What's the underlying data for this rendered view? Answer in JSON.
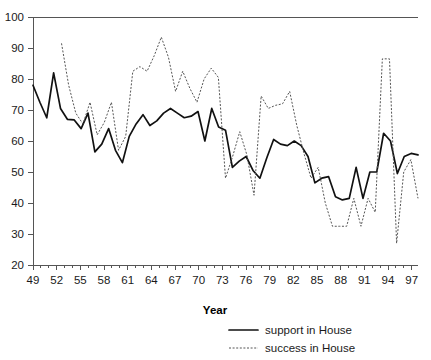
{
  "chart_data": {
    "type": "line",
    "title": "",
    "xlabel": "Year",
    "ylabel": "",
    "xlim": [
      49,
      97.8
    ],
    "ylim": [
      20,
      100
    ],
    "grid": false,
    "legend_position": "bottom-right",
    "x_tick_labels": [
      "49",
      "52",
      "55",
      "58",
      "61",
      "64",
      "67",
      "70",
      "73",
      "76",
      "79",
      "82",
      "85",
      "88",
      "91",
      "94",
      "97"
    ],
    "x_tick_values": [
      49,
      52,
      55,
      58,
      61,
      64,
      67,
      70,
      73,
      76,
      79,
      82,
      85,
      88,
      91,
      94,
      97
    ],
    "x_minor_tick_values": [
      50,
      51,
      53,
      54,
      56,
      57,
      59,
      60,
      62,
      63,
      65,
      66,
      68,
      69,
      71,
      72,
      74,
      75,
      77,
      78,
      80,
      81,
      83,
      84,
      86,
      87,
      89,
      90,
      92,
      93,
      95,
      96
    ],
    "y_tick_labels": [
      "20",
      "30",
      "40",
      "50",
      "60",
      "70",
      "80",
      "90",
      "100"
    ],
    "y_tick_values": [
      20,
      30,
      40,
      50,
      60,
      70,
      80,
      90,
      100
    ],
    "x": [
      49,
      50,
      51,
      52,
      53,
      54,
      55,
      56,
      57,
      58,
      59,
      60,
      61,
      62,
      63,
      64,
      65,
      66,
      67,
      68,
      69,
      70,
      71,
      72,
      73,
      74,
      75,
      76,
      77,
      78,
      79,
      80,
      81,
      82,
      83,
      84,
      85,
      86,
      87,
      88,
      89,
      90,
      91,
      92,
      93,
      94,
      95,
      96,
      97
    ],
    "series": [
      {
        "name": "support in House",
        "style": "solid",
        "color": "#111111",
        "values": [
          78.0,
          72.5,
          67.5,
          82.0,
          70.5,
          67.0,
          66.8,
          64.0,
          69.0,
          56.5,
          59.0,
          64.0,
          57.0,
          53.0,
          61.5,
          65.5,
          68.5,
          65.0,
          66.5,
          69.0,
          70.5,
          69.0,
          67.5,
          68.0,
          69.5,
          60.0,
          70.5,
          64.5,
          63.5,
          51.5,
          53.5,
          55.0,
          50.5,
          48.0,
          54.5,
          60.5,
          59.0,
          58.5,
          60.0,
          58.5,
          55.0,
          46.5,
          48.0,
          48.5,
          42.0,
          41.0,
          41.5,
          51.5,
          41.5
        ]
      },
      {
        "name": "success in House",
        "style": "dotted",
        "color": "#555555",
        "values": [
          null,
          null,
          null,
          null,
          91.5,
          78.0,
          69.0,
          65.5,
          72.5,
          62.0,
          66.0,
          72.5,
          57.0,
          61.5,
          82.5,
          84.0,
          82.5,
          87.5,
          93.5,
          87.0,
          76.0,
          82.5,
          77.0,
          72.5,
          80.0,
          83.5,
          80.5,
          48.0,
          55.0,
          63.0,
          55.5,
          42.5,
          74.5,
          70.5,
          71.5,
          72.0,
          76.0,
          65.0,
          56.0,
          48.0,
          51.5,
          40.0,
          32.5,
          32.5,
          32.5,
          41.5,
          32.5,
          41.5,
          37.0
        ]
      }
    ],
    "series_tail": {
      "support_in_House": [
        50.0,
        50.0,
        62.5,
        60.0,
        49.5,
        55.0,
        56.0,
        55.5
      ],
      "success_in_House": [
        86.5,
        86.5,
        27.0,
        50.0,
        54.0,
        41.5
      ]
    },
    "legend": [
      {
        "label": "support in House",
        "style": "solid"
      },
      {
        "label": "success in House",
        "style": "dotted"
      }
    ]
  }
}
